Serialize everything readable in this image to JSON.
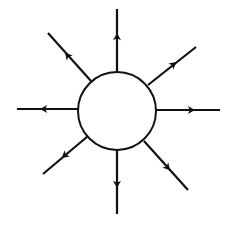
{
  "diagram": {
    "type": "radial-field-lines",
    "colors": {
      "stroke": "#111111",
      "fill": "#ffffff",
      "background": "#ffffff"
    },
    "circle": {
      "cx": 117,
      "cy": 111,
      "r": 39
    },
    "field_lines": [
      {
        "direction": "up",
        "x1": 117,
        "y1": 72,
        "x2": 117,
        "y2": 9,
        "ax": 117,
        "ay": 36
      },
      {
        "direction": "up-right",
        "x1": 148,
        "y1": 85,
        "x2": 196,
        "y2": 47,
        "ax": 174,
        "ay": 64
      },
      {
        "direction": "right",
        "x1": 156,
        "y1": 110,
        "x2": 220,
        "y2": 110,
        "ax": 192,
        "ay": 110
      },
      {
        "direction": "down-right",
        "x1": 144,
        "y1": 141,
        "x2": 188,
        "y2": 190,
        "ax": 168,
        "ay": 168
      },
      {
        "direction": "down",
        "x1": 117,
        "y1": 150,
        "x2": 117,
        "y2": 214,
        "ax": 117,
        "ay": 185
      },
      {
        "direction": "down-left",
        "x1": 88,
        "y1": 136,
        "x2": 43,
        "y2": 174,
        "ax": 64,
        "ay": 156
      },
      {
        "direction": "left",
        "x1": 79,
        "y1": 109,
        "x2": 17,
        "y2": 109,
        "ax": 43,
        "ay": 109
      },
      {
        "direction": "up-left",
        "x1": 91,
        "y1": 81,
        "x2": 48,
        "y2": 33,
        "ax": 67,
        "ay": 55
      }
    ]
  }
}
